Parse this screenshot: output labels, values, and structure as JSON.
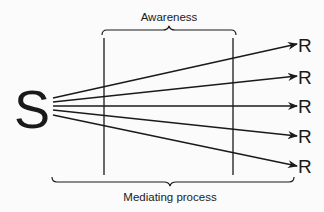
{
  "diagram": {
    "top_label": "Awareness",
    "bottom_label": "Mediating process",
    "stimulus": "S",
    "responses": [
      "R",
      "R",
      "R",
      "R",
      "R"
    ],
    "colors": {
      "ink": "#1a1a1a",
      "background": "#fbfbfb"
    }
  }
}
